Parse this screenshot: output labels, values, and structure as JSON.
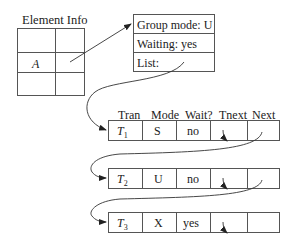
{
  "element_info": {
    "title": "Element Info",
    "row_label": "A"
  },
  "lock_info": {
    "group_mode": "Group mode: U",
    "waiting": "Waiting: yes",
    "list": "List:"
  },
  "table": {
    "headers": [
      "Tran",
      "Mode",
      "Wait?",
      "Tnext",
      "Next"
    ],
    "rows": [
      {
        "tran": "T",
        "sub": "1",
        "mode": "S",
        "wait": "no"
      },
      {
        "tran": "T",
        "sub": "2",
        "mode": "U",
        "wait": "no"
      },
      {
        "tran": "T",
        "sub": "3",
        "mode": "X",
        "wait": "yes"
      }
    ]
  }
}
